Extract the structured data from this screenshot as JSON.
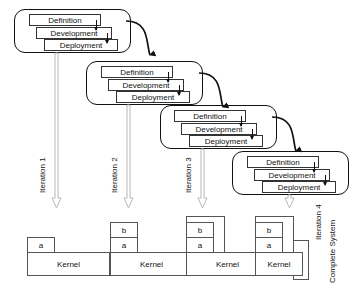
{
  "diagram": {
    "phase_labels": [
      "Definition",
      "Development",
      "Deployment"
    ],
    "kernel_label": "Kernel",
    "complete_system_label": "Complete System",
    "colors": {
      "outline": "#111111",
      "phase_border": "#333333",
      "kernel_border": "#555555",
      "gray_arrow": "#b8b8b8",
      "background": "#ffffff"
    },
    "iterations": [
      {
        "id": 1,
        "label": "Iteration 1",
        "phases": [
          "Definition",
          "Development",
          "Deployment"
        ],
        "kernel": {
          "base_label": "Kernel",
          "increments": [
            "a"
          ]
        }
      },
      {
        "id": 2,
        "label": "Iteration 2",
        "phases": [
          "Definition",
          "Development",
          "Deployment"
        ],
        "kernel": {
          "base_label": "Kernel",
          "increments": [
            "b",
            "a"
          ]
        }
      },
      {
        "id": 3,
        "label": "Iteration 3",
        "phases": [
          "Definition",
          "Development",
          "Deployment"
        ],
        "kernel": {
          "base_label": "Kernel",
          "increments": [
            "b",
            "a",
            "c"
          ]
        }
      },
      {
        "id": 4,
        "label": "Iteration 4",
        "phases": [
          "Definition",
          "Development",
          "Deployment"
        ],
        "kernel": {
          "base_label": "Kernel",
          "increments": [
            "b",
            "a",
            "c",
            "d"
          ]
        }
      }
    ],
    "kernel_cells": {
      "k1": {
        "a": "a",
        "kernel": "Kernel"
      },
      "k2": {
        "a": "a",
        "b": "b",
        "kernel": "Kernel"
      },
      "k3": {
        "a": "a",
        "b": "b",
        "c": "c",
        "kernel": "Kernel"
      },
      "k4": {
        "a": "a",
        "b": "b",
        "c": "c",
        "d": "d",
        "kernel": "Kernel"
      }
    }
  }
}
